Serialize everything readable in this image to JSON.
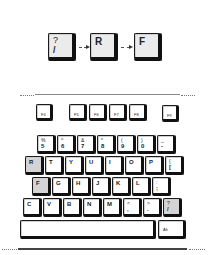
{
  "sequence": {
    "keys": [
      {
        "top": "?",
        "bottom": "/"
      },
      {
        "label": "R"
      },
      {
        "label": "F"
      }
    ]
  },
  "function_row": [
    "F4",
    "F5",
    "F6",
    "F7",
    "F8",
    "F9"
  ],
  "number_row": [
    {
      "top": "%",
      "bottom": "5"
    },
    {
      "top": "^",
      "bottom": "6"
    },
    {
      "top": "&",
      "bottom": "7"
    },
    {
      "top": "*",
      "bottom": "8"
    },
    {
      "top": "(",
      "bottom": "9"
    },
    {
      "top": ")",
      "bottom": "0"
    },
    {
      "top": "_",
      "bottom": "-"
    }
  ],
  "row_r": [
    "R",
    "T",
    "Y",
    "U",
    "I",
    "O",
    "P",
    {
      "top": "{",
      "bottom": "["
    }
  ],
  "row_f": [
    "F",
    "G",
    "H",
    "J",
    "K",
    "L",
    {
      "top": ":",
      "bottom": ";"
    }
  ],
  "row_c": [
    "C",
    "V",
    "B",
    "N",
    "M",
    {
      "top": "<",
      "bottom": ","
    },
    {
      "top": ">",
      "bottom": "."
    },
    {
      "top": "?",
      "bottom": "/"
    }
  ],
  "bottom_row": {
    "spacebar": "",
    "alt": "Alt"
  },
  "highlighted_keys": [
    "R",
    "F",
    "?/"
  ],
  "colors": {
    "key_face": "#ffffff",
    "key_highlight": "#d4d4d4",
    "key_edge": "#111111"
  }
}
